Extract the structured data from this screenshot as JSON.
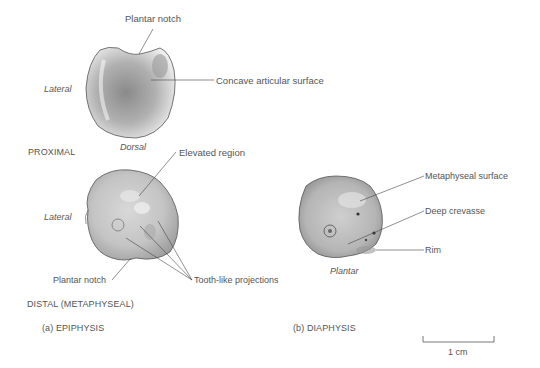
{
  "figure": {
    "panel_a": {
      "caption": "(a) EPIPHYSIS",
      "proximal": {
        "section_label": "PROXIMAL",
        "orientation_left": "Lateral",
        "orientation_bottom": "Dorsal",
        "callouts": {
          "plantar_notch": "Plantar notch",
          "concave_surface": "Concave articular surface"
        }
      },
      "distal": {
        "section_label": "DISTAL (METAPHYSEAL)",
        "orientation_left": "Lateral",
        "callouts": {
          "elevated_region": "Elevated region",
          "plantar_notch": "Plantar notch",
          "tooth_projections": "Tooth-like projections"
        }
      }
    },
    "panel_b": {
      "caption": "(b) DIAPHYSIS",
      "orientation_bottom": "Plantar",
      "callouts": {
        "metaphyseal_surface": "Metaphyseal surface",
        "deep_crevasse": "Deep crevasse",
        "rim": "Rim"
      }
    },
    "scale_bar": {
      "label": "1 cm"
    }
  }
}
